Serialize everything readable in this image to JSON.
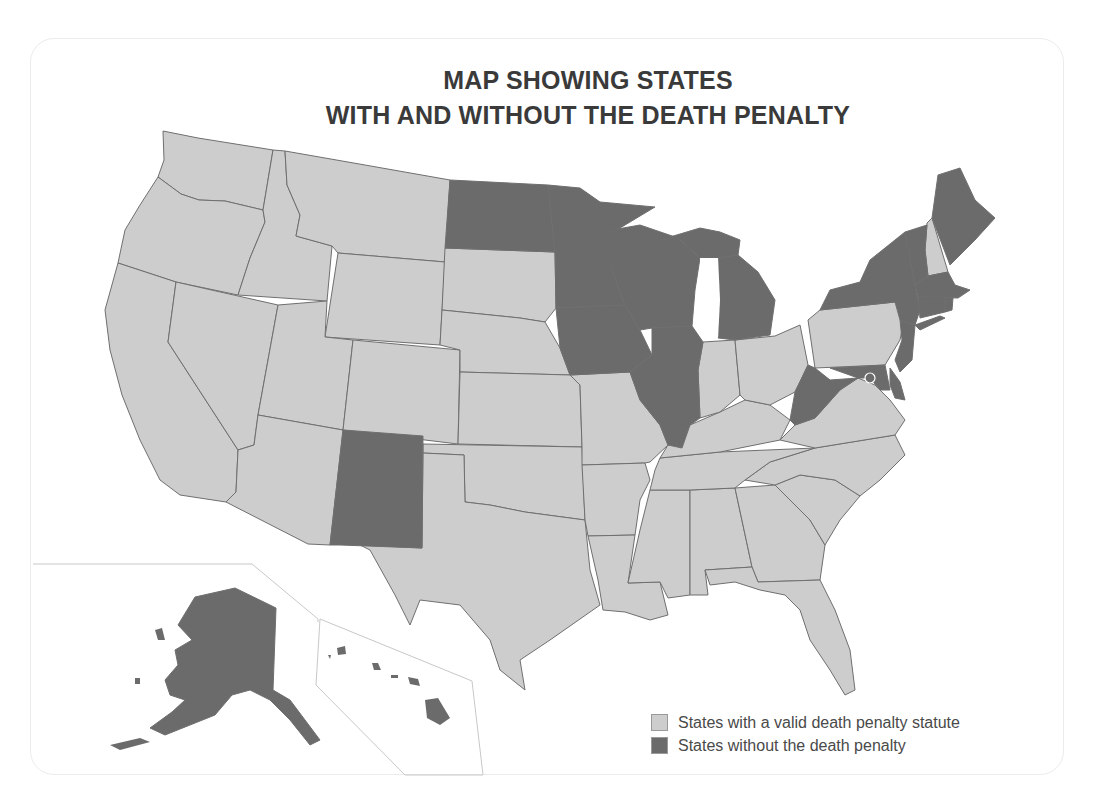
{
  "title": {
    "line1": "MAP SHOWING STATES",
    "line2": "WITH AND WITHOUT THE DEATH PENALTY"
  },
  "colors": {
    "with_death_penalty": "#cdcdcd",
    "without_death_penalty": "#6b6b6b",
    "border": "#6f6f6f",
    "water": "#ffffff"
  },
  "legend": {
    "items": [
      {
        "label": "States with a valid death penalty statute",
        "color": "#cdcdcd"
      },
      {
        "label": "States without the death penalty",
        "color": "#6b6b6b"
      }
    ]
  },
  "map_data": {
    "without_death_penalty": [
      "Alaska",
      "Hawaii",
      "North Dakota",
      "Minnesota",
      "Iowa",
      "Wisconsin",
      "Michigan",
      "Illinois",
      "New Mexico",
      "West Virginia",
      "Maryland",
      "Delaware",
      "New Jersey",
      "New York",
      "Vermont",
      "Maine",
      "Massachusetts",
      "Rhode Island",
      "Connecticut",
      "District of Columbia"
    ],
    "with_death_penalty": [
      "Washington",
      "Oregon",
      "California",
      "Idaho",
      "Nevada",
      "Montana",
      "Wyoming",
      "Utah",
      "Arizona",
      "Colorado",
      "South Dakota",
      "Nebraska",
      "Kansas",
      "Oklahoma",
      "Texas",
      "Missouri",
      "Arkansas",
      "Louisiana",
      "Mississippi",
      "Alabama",
      "Tennessee",
      "Kentucky",
      "Indiana",
      "Ohio",
      "Pennsylvania",
      "Virginia",
      "North Carolina",
      "South Carolina",
      "Georgia",
      "Florida",
      "New Hampshire"
    ]
  }
}
